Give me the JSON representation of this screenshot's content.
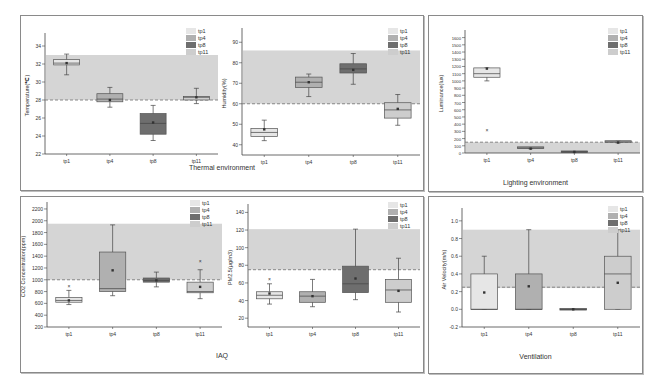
{
  "panels": [
    {
      "id": "thermal",
      "title": "Thermal environment",
      "x": 20,
      "y": 15,
      "w": 402,
      "h": 174,
      "title_y": 148
    },
    {
      "id": "lighting",
      "title": "Lighting environment",
      "x": 428,
      "y": 15,
      "w": 213,
      "h": 175,
      "title_y": 163
    },
    {
      "id": "iaq",
      "title": "IAQ",
      "x": 20,
      "y": 196,
      "w": 402,
      "h": 175,
      "title_y": 155
    },
    {
      "id": "ventilation",
      "title": "Ventilation",
      "x": 428,
      "y": 196,
      "w": 213,
      "h": 176,
      "title_y": 156
    }
  ],
  "legend": {
    "entries": [
      "tp1",
      "tp4",
      "tp8",
      "tp11"
    ],
    "colors": [
      "#e6e6e6",
      "#b0b0b0",
      "#6e6e6e",
      "#cdcdcd"
    ]
  },
  "colors": {
    "comfort_band": "#d5d5d5",
    "threshold_line": "#7a7a7a",
    "axis": "#444444",
    "whisker": "#444444"
  },
  "chart_data": [
    {
      "type": "box",
      "id": "temperature",
      "panel": "thermal",
      "title": "",
      "xlabel": "",
      "ylabel": "Temperature(℃)",
      "categories": [
        "tp1",
        "tp4",
        "tp8",
        "tp11"
      ],
      "ylim": [
        22,
        35
      ],
      "yticks": [
        22,
        24,
        26,
        28,
        30,
        32,
        34
      ],
      "band": [
        28,
        33
      ],
      "threshold": 28,
      "plot": {
        "x0": 45,
        "x1": 218,
        "y0": 154,
        "y1": 37
      },
      "series": [
        {
          "name": "tp1",
          "min": 30.8,
          "q1": 31.9,
          "median": 32.1,
          "q3": 32.5,
          "max": 33.1,
          "mean": 32.1
        },
        {
          "name": "tp4",
          "min": 27.2,
          "q1": 27.8,
          "median": 28.1,
          "q3": 28.7,
          "max": 29.4,
          "mean": 28.0
        },
        {
          "name": "tp8",
          "min": 23.5,
          "q1": 24.2,
          "median": 25.4,
          "q3": 26.5,
          "max": 27.4,
          "mean": 25.5
        },
        {
          "name": "tp11",
          "min": 27.6,
          "q1": 28.0,
          "median": 28.3,
          "q3": 28.4,
          "max": 29.3,
          "mean": 28.3
        }
      ]
    },
    {
      "type": "box",
      "id": "humidity",
      "panel": "thermal",
      "title": "",
      "xlabel": "",
      "ylabel": "Humidity(%)",
      "categories": [
        "tp1",
        "tp4",
        "tp8",
        "tp11"
      ],
      "ylim": [
        35,
        95
      ],
      "yticks": [
        40,
        50,
        60,
        70,
        80,
        90
      ],
      "band": [
        60,
        86
      ],
      "threshold": 60,
      "plot": {
        "x0": 242,
        "x1": 420,
        "y0": 155,
        "y1": 32
      },
      "series": [
        {
          "name": "tp1",
          "min": 42,
          "q1": 44,
          "median": 46,
          "q3": 48,
          "max": 52,
          "mean": 47.5
        },
        {
          "name": "tp4",
          "min": 63.5,
          "q1": 68,
          "median": 70.5,
          "q3": 73,
          "max": 74.5,
          "mean": 70.5
        },
        {
          "name": "tp8",
          "min": 69.5,
          "q1": 75,
          "median": 77,
          "q3": 79.5,
          "max": 84.5,
          "mean": 76.5
        },
        {
          "name": "tp11",
          "min": 49.5,
          "q1": 53,
          "median": 57,
          "q3": 60.5,
          "max": 64.5,
          "mean": 57.5
        }
      ]
    },
    {
      "type": "box",
      "id": "luminance",
      "panel": "lighting",
      "title": "",
      "xlabel": "",
      "ylabel": "Luminance(lux)",
      "categories": [
        "tp1",
        "tp4",
        "tp8",
        "tp11"
      ],
      "ylim": [
        0,
        1650
      ],
      "yticks": [
        0,
        100,
        200,
        300,
        400,
        500,
        600,
        700,
        800,
        900,
        1000,
        1100,
        1200,
        1300,
        1400,
        1500,
        1600
      ],
      "band": [
        0,
        150
      ],
      "threshold": 150,
      "plot": {
        "x0": 465,
        "x1": 640,
        "y0": 153,
        "y1": 34
      },
      "series": [
        {
          "name": "tp1",
          "min": 1000,
          "q1": 1050,
          "median": 1100,
          "q3": 1180,
          "max": 1180,
          "mean": 1170,
          "outliers": [
            320
          ]
        },
        {
          "name": "tp4",
          "min": 60,
          "q1": 70,
          "median": 70,
          "q3": 75,
          "max": 75,
          "mean": 60
        },
        {
          "name": "tp8",
          "min": 10,
          "q1": 15,
          "median": 15,
          "q3": 18,
          "max": 18,
          "mean": 15
        },
        {
          "name": "tp11",
          "min": 140,
          "q1": 150,
          "median": 155,
          "q3": 160,
          "max": 165,
          "mean": 145
        }
      ]
    },
    {
      "type": "box",
      "id": "co2",
      "panel": "iaq",
      "title": "",
      "xlabel": "",
      "ylabel": "CO2 Concentration(ppm)",
      "categories": [
        "tp1",
        "tp4",
        "tp8",
        "tp11"
      ],
      "ylim": [
        200,
        2250
      ],
      "yticks": [
        200,
        400,
        600,
        800,
        1000,
        1200,
        1400,
        1600,
        1800,
        2000,
        2200
      ],
      "band": [
        1000,
        1950
      ],
      "threshold": 1000,
      "plot": {
        "x0": 47,
        "x1": 222,
        "y0": 327,
        "y1": 206
      },
      "series": [
        {
          "name": "tp1",
          "min": 580,
          "q1": 620,
          "median": 650,
          "q3": 700,
          "max": 820,
          "mean": 650,
          "outliers": [
            900
          ]
        },
        {
          "name": "tp4",
          "min": 730,
          "q1": 800,
          "median": 850,
          "q3": 1470,
          "max": 1930,
          "mean": 1160
        },
        {
          "name": "tp8",
          "min": 880,
          "q1": 960,
          "median": 990,
          "q3": 1030,
          "max": 1130,
          "mean": 990
        },
        {
          "name": "tp11",
          "min": 680,
          "q1": 780,
          "median": 800,
          "q3": 960,
          "max": 1170,
          "mean": 880,
          "outliers": [
            1310
          ]
        }
      ]
    },
    {
      "type": "box",
      "id": "pm25",
      "panel": "iaq",
      "title": "",
      "xlabel": "",
      "ylabel": "PM2.5(μg/m3)",
      "categories": [
        "tp1",
        "tp4",
        "tp8",
        "tp11"
      ],
      "ylim": [
        10,
        145
      ],
      "yticks": [
        20,
        40,
        60,
        80,
        100,
        120,
        140
      ],
      "band": [
        75,
        121
      ],
      "threshold": 75,
      "plot": {
        "x0": 248,
        "x1": 420,
        "y0": 327,
        "y1": 208
      },
      "series": [
        {
          "name": "tp1",
          "min": 36,
          "q1": 42,
          "median": 46,
          "q3": 50,
          "max": 59,
          "mean": 48,
          "outliers": [
            65
          ]
        },
        {
          "name": "tp4",
          "min": 33,
          "q1": 38,
          "median": 45,
          "q3": 50,
          "max": 64,
          "mean": 45
        },
        {
          "name": "tp8",
          "min": 41,
          "q1": 49,
          "median": 59,
          "q3": 79,
          "max": 121,
          "mean": 65
        },
        {
          "name": "tp11",
          "min": 27,
          "q1": 38,
          "median": 52,
          "q3": 64,
          "max": 88,
          "mean": 51
        }
      ]
    },
    {
      "type": "box",
      "id": "air_velocity",
      "panel": "ventilation",
      "title": "",
      "xlabel": "",
      "ylabel": "Air Velocity(m/s)",
      "categories": [
        "tp1",
        "tp4",
        "tp8",
        "tp11"
      ],
      "ylim": [
        -0.2,
        1.1
      ],
      "yticks": [
        -0.2,
        0.0,
        0.2,
        0.4,
        0.6,
        0.8,
        1.0
      ],
      "band": [
        0.24,
        0.9
      ],
      "threshold": 0.25,
      "plot": {
        "x0": 462,
        "x1": 640,
        "y0": 327,
        "y1": 212
      },
      "series": [
        {
          "name": "tp1",
          "min": 0.0,
          "q1": 0.0,
          "median": 0.0,
          "q3": 0.4,
          "max": 0.6,
          "mean": 0.19
        },
        {
          "name": "tp4",
          "min": 0.0,
          "q1": 0.0,
          "median": 0.0,
          "q3": 0.4,
          "max": 0.9,
          "mean": 0.26
        },
        {
          "name": "tp8",
          "min": 0.0,
          "q1": 0.0,
          "median": 0.0,
          "q3": 0.0,
          "max": 0.0,
          "mean": 0.0
        },
        {
          "name": "tp11",
          "min": 0.0,
          "q1": 0.0,
          "median": 0.4,
          "q3": 0.6,
          "max": 0.9,
          "mean": 0.3
        }
      ]
    }
  ]
}
